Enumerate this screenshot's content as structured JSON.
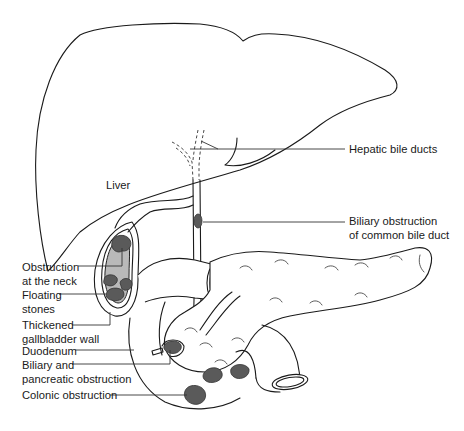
{
  "diagram": {
    "colors": {
      "outline": "#1a1a1a",
      "stone": "#5a5a5a",
      "gallbladder_bile": "#b9b9b9",
      "background": "#ffffff"
    },
    "organs": [
      "liver",
      "gallbladder",
      "common-bile-duct",
      "hepatic-bile-ducts",
      "duodenum",
      "pancreas",
      "colon"
    ],
    "labels": {
      "liver": "Liver",
      "hepatic_bile_ducts": "Hepatic bile ducts",
      "cbd_line1": "Biliary obstruction",
      "cbd_line2": "of common bile duct",
      "neck_line1": "Obstruction",
      "neck_line2": "at the neck",
      "floating_line1": "Floating",
      "floating_line2": "stones",
      "wall_line1": "Thickened",
      "wall_line2": "gallbladder wall",
      "duodenum": "Duodenum",
      "pancreatic_line1": "Biliary and",
      "pancreatic_line2": "pancreatic obstruction",
      "colonic": "Colonic obstruction"
    }
  }
}
